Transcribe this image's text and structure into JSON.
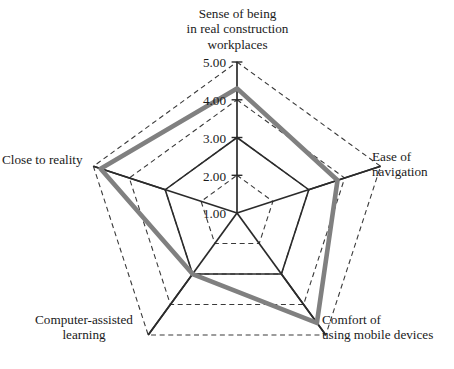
{
  "chart_data": {
    "type": "radar",
    "title": "",
    "categories": [
      "Sense of being\nin real construction\nworkplaces",
      "Ease of\nnavigation",
      "Comfort of\nusing mobile devices",
      "Computer-assisted\nlearning",
      "Close to reality"
    ],
    "values": [
      4.3,
      3.8,
      4.6,
      3.0,
      4.8
    ],
    "series": [
      {
        "name": "Evaluation score",
        "values": [
          4.3,
          3.8,
          4.6,
          3.0,
          4.8
        ],
        "color": "#808080"
      }
    ],
    "tick_labels": [
      "1.00",
      "2.00",
      "3.00",
      "4.00",
      "5.00"
    ],
    "tick_values": [
      1.0,
      2.0,
      3.0,
      4.0,
      5.0
    ],
    "rlim": [
      1.0,
      5.0
    ],
    "grid": "dashed-pentagon",
    "grid_color": "#3a3a3a",
    "axis_color": "#2b2b2b",
    "legend": "none",
    "xlabel": "",
    "ylabel": ""
  },
  "axis_labels": {
    "top": "Sense of being\nin real construction\nworkplaces",
    "right": "Ease of\nnavigation",
    "bottom_right": "Comfort of\nusing mobile devices",
    "bottom_left": "Computer-assisted\nlearning",
    "left": "Close to reality"
  },
  "ticks": {
    "t5": "5.00",
    "t4": "4.00",
    "t3": "3.00",
    "t2": "2.00",
    "t1": "1.00"
  },
  "colors": {
    "data_line": "#808080",
    "grid_line": "#3a3a3a",
    "spoke_line": "#2b2b2b",
    "text": "#1a1a1a",
    "background": "#ffffff"
  }
}
